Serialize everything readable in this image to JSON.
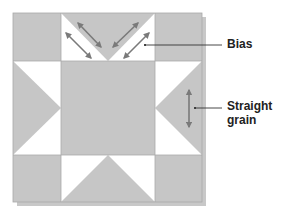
{
  "colors": {
    "fabric_dark": "#c6c6c6",
    "fabric_light": "#ffffff",
    "seam": "#a9a9a9",
    "arrow": "#7a7a7a",
    "leader": "#333333",
    "shadow": "#9a9a9a"
  },
  "block": {
    "pattern": "Sawtooth star",
    "grid": "3x3 (large center square, corner squares, four flying-geese units)",
    "units": [
      {
        "name": "corner-top-left",
        "type": "square",
        "fill": "fabric_dark"
      },
      {
        "name": "flying-geese-top",
        "type": "flying-geese",
        "goose_points": "down",
        "arrows": "bias"
      },
      {
        "name": "corner-top-right",
        "type": "square",
        "fill": "fabric_dark"
      },
      {
        "name": "flying-geese-left",
        "type": "flying-geese",
        "goose_points": "right"
      },
      {
        "name": "center-square",
        "type": "square",
        "fill": "fabric_dark"
      },
      {
        "name": "flying-geese-right",
        "type": "flying-geese",
        "goose_points": "left",
        "arrows": "straight-grain"
      },
      {
        "name": "corner-bottom-left",
        "type": "square",
        "fill": "fabric_dark"
      },
      {
        "name": "flying-geese-bottom",
        "type": "flying-geese",
        "goose_points": "up"
      },
      {
        "name": "corner-bottom-right",
        "type": "square",
        "fill": "fabric_dark"
      }
    ]
  },
  "labels": {
    "bias": "Bias",
    "straight_grain_line1": "Straight",
    "straight_grain_line2": "grain"
  }
}
